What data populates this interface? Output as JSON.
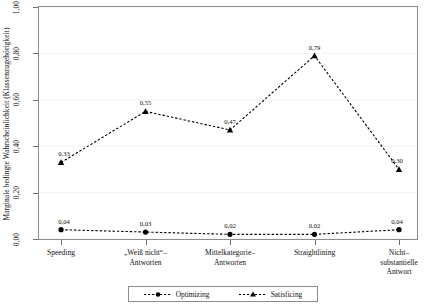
{
  "chart_data": {
    "type": "line",
    "title": "",
    "subtitle": "",
    "xlabel": "",
    "ylabel": "Marginale bedingte Wahrscheinlichkeit (Klassenzugehörigkeit)",
    "categories": [
      "Speeding",
      "„Weiß nicht“–\nAntworten",
      "Mittelkategorie–\nAntworten",
      "Straightlining",
      "Nicht–\nsubstantielle\nAntwort"
    ],
    "category_lines": [
      [
        "Speeding"
      ],
      [
        "„Weiß nicht“–",
        "Antworten"
      ],
      [
        "Mittelkategorie–",
        "Antworten"
      ],
      [
        "Straightlining"
      ],
      [
        "Nicht–",
        "substantielle",
        "Antwort"
      ]
    ],
    "ylim": [
      0.0,
      1.0
    ],
    "yticks": [
      0.0,
      0.2,
      0.4,
      0.6,
      0.8,
      1.0
    ],
    "ytick_labels": [
      "0,00",
      "0,20",
      "0,40",
      "0,60",
      "0,80",
      "1,00"
    ],
    "grid": true,
    "legend_position": "bottom-center",
    "series": [
      {
        "name": "Optimizing",
        "marker": "circle",
        "linestyle": "dashed",
        "color": "#000000",
        "values": [
          0.04,
          0.03,
          0.02,
          0.02,
          0.04
        ],
        "value_labels": [
          "0,04",
          "0,03",
          "0,02",
          "0,02",
          "0,04"
        ]
      },
      {
        "name": "Satisficing",
        "marker": "triangle",
        "linestyle": "dashed",
        "color": "#000000",
        "values": [
          0.33,
          0.55,
          0.47,
          0.79,
          0.3
        ],
        "value_labels": [
          "0,33",
          "0,55",
          "0,47",
          "0,79",
          "0,30"
        ]
      }
    ]
  },
  "legend": {
    "entries": [
      {
        "label": "Optimizing",
        "marker": "circle"
      },
      {
        "label": "Satisficing",
        "marker": "triangle"
      }
    ]
  }
}
